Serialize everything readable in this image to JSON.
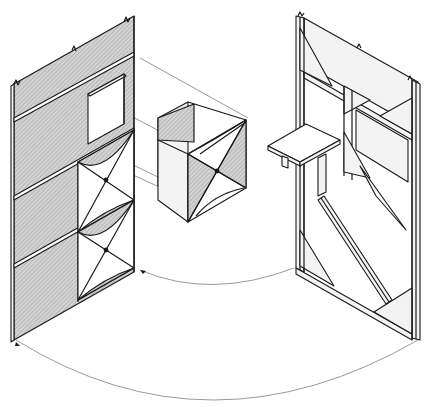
{
  "figure": {
    "type": "isometric-exploded-construction-diagram",
    "width": 431,
    "height": 407,
    "colors": {
      "line": "#1a1a1a",
      "hatch_fill": "#c8c8c8",
      "light_fill": "#f3f3f3",
      "background": "#ffffff",
      "leader": "#555555"
    },
    "components": [
      {
        "id": "left-panel",
        "label": "Left wall panel with window opening and three stacked diagonal-brace modules"
      },
      {
        "id": "center-box",
        "label": "Detached cube module with X-brace and curved gussets"
      },
      {
        "id": "right-frame",
        "label": "Right wall frame with triangular gussets, diagonal strut and fold-out shelf"
      },
      {
        "id": "shelf",
        "label": "Fold-out shelf with two support legs"
      }
    ],
    "leaders": [
      {
        "id": "leader-top",
        "label": "Straight leader from left panel top rail to center box"
      },
      {
        "id": "leader-window",
        "label": "Straight leader from window to center box"
      },
      {
        "id": "arc-inner",
        "label": "Curved arc between left panel base and right frame base (inner)"
      },
      {
        "id": "arc-outer",
        "label": "Curved arc between left panel foot and right frame foot (outer)"
      }
    ],
    "text_labels": []
  }
}
